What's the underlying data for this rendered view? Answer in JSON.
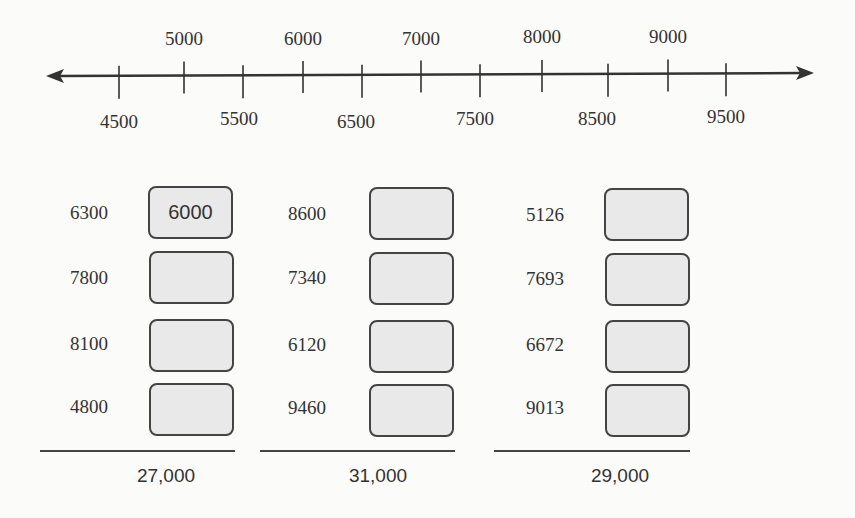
{
  "number_line": {
    "upper_labels": [
      {
        "text": "5000",
        "x": 184
      },
      {
        "text": "6000",
        "x": 303
      },
      {
        "text": "7000",
        "x": 421
      },
      {
        "text": "8000",
        "x": 542
      },
      {
        "text": "9000",
        "x": 668
      }
    ],
    "lower_labels": [
      {
        "text": "4500",
        "x": 119
      },
      {
        "text": "5500",
        "x": 243
      },
      {
        "text": "6500",
        "x": 362
      },
      {
        "text": "7500",
        "x": 480
      },
      {
        "text": "8500",
        "x": 608
      },
      {
        "text": "9500",
        "x": 726
      }
    ],
    "ticks_x": [
      119,
      184,
      243,
      303,
      362,
      421,
      480,
      542,
      608,
      668,
      726
    ]
  },
  "columns": [
    {
      "numbers": [
        "6300",
        "7800",
        "8100",
        "4800"
      ],
      "answers": [
        "6000",
        "",
        "",
        ""
      ],
      "total": "27,000"
    },
    {
      "numbers": [
        "8600",
        "7340",
        "6120",
        "9460"
      ],
      "answers": [
        "",
        "",
        "",
        ""
      ],
      "total": "31,000"
    },
    {
      "numbers": [
        "5126",
        "7693",
        "6672",
        "9013"
      ],
      "answers": [
        "",
        "",
        "",
        ""
      ],
      "total": "29,000"
    }
  ],
  "colors": {
    "line": "#333333",
    "box_fill": "#e9e9e9",
    "box_border": "#444444",
    "background": "#fbfbfa"
  }
}
